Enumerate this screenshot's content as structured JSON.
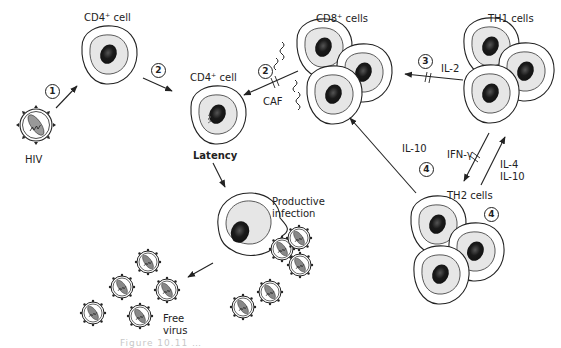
{
  "labels": {
    "hiv": "HIV",
    "cd4_cell_top": "CD4⁺ cell",
    "cd4_cell_latent": "CD4⁺ cell",
    "latency": "Latency",
    "cd8_cells": "CD8⁺ cells",
    "th1_cells": "TH1 cells",
    "th2_cells": "TH2 cells",
    "caf": "CAF",
    "il2": "IL-2",
    "il10_left": "IL-10",
    "ifn_gamma": "IFN-γ",
    "il4": "IL-4",
    "il10_right": "IL-10",
    "productive_infection_1": "Productive",
    "productive_infection_2": "infection",
    "free_virus_1": "Free",
    "free_virus_2": "virus"
  },
  "steps": {
    "step1": "1",
    "step2a": "2",
    "step2b": "2",
    "step3": "3",
    "step4a": "4",
    "step4b": "4"
  },
  "caption": "Figure 10.11 …",
  "colors": {
    "outline": "#222222",
    "cytoplasm": "#e6e6e6",
    "nucleus": "#1a1a1a"
  }
}
